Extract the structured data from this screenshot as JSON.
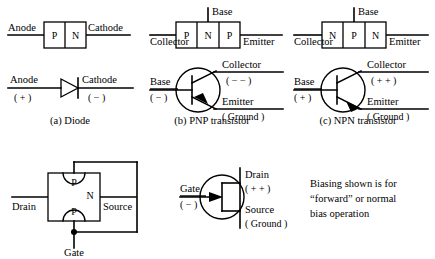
{
  "figure": {
    "line_color": "#000000",
    "background_color": "#ffffff"
  },
  "panels": [
    {
      "id": "diode",
      "caption": "(a) Diode",
      "structure": {
        "left_terminal": "Anode",
        "right_terminal": "Cathode",
        "regions": [
          "P",
          "N"
        ]
      },
      "symbol": {
        "left_terminal": "Anode",
        "left_polarity": "( + )",
        "right_terminal": "Cathode",
        "right_polarity": "( − )",
        "symbol_name": "diode-symbol"
      }
    },
    {
      "id": "pnp",
      "caption": "(b) PNP transistor",
      "structure": {
        "left_terminal": "Collector",
        "right_terminal": "Emitter",
        "top_terminal": "Base",
        "regions": [
          "P",
          "N",
          "P"
        ]
      },
      "symbol": {
        "base_label": "Base",
        "base_polarity": "( − )",
        "collector_label": "Collector",
        "collector_polarity": "( − − )",
        "emitter_label": "Emitter",
        "emitter_polarity": "( Ground )",
        "arrow_direction": "inward-on-emitter",
        "symbol_name": "pnp-transistor-symbol"
      }
    },
    {
      "id": "npn",
      "caption": "(c) NPN transistor",
      "structure": {
        "left_terminal": "Collector",
        "right_terminal": "Emitter",
        "top_terminal": "Base",
        "regions": [
          "N",
          "P",
          "N"
        ]
      },
      "symbol": {
        "base_label": "Base",
        "base_polarity": "( + )",
        "collector_label": "Collector",
        "collector_polarity": "( + + )",
        "emitter_label": "Emitter",
        "emitter_polarity": "( Ground )",
        "arrow_direction": "outward-on-emitter",
        "symbol_name": "npn-transistor-symbol"
      }
    },
    {
      "id": "jfet",
      "caption": "",
      "structure": {
        "left_terminal": "Drain",
        "right_terminal": "Source",
        "bottom_terminal": "Gate",
        "channel_region": "N",
        "gate_regions": [
          "P",
          "P"
        ]
      },
      "symbol": {
        "gate_label": "Gate",
        "gate_polarity": "( − )",
        "drain_label": "Drain",
        "drain_polarity": "( + + )",
        "source_label": "Source",
        "source_polarity": "( Ground )",
        "arrow_direction": "inward-on-gate",
        "symbol_name": "jfet-symbol"
      }
    }
  ],
  "note": {
    "lines": [
      "Biasing shown is for",
      "“forward” or normal",
      "bias  operation"
    ]
  }
}
